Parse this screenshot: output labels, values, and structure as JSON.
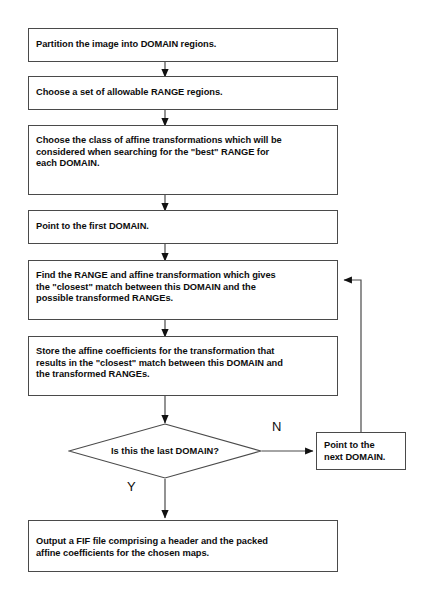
{
  "diagram": {
    "background_color": "#ffffff",
    "line_color": "#4a4a4a",
    "text_color": "#0d0d0d",
    "nodes": [
      {
        "id": "partition",
        "type": "process",
        "text": "Partition the image into DOMAIN regions."
      },
      {
        "id": "choose-range",
        "type": "process",
        "text": "Choose a set of allowable RANGE regions."
      },
      {
        "id": "choose-affine",
        "type": "process",
        "text": "Choose the class of affine transformations which will be\nconsidered when searching for the \"best\" RANGE for\neach DOMAIN."
      },
      {
        "id": "point-first",
        "type": "process",
        "text": "Point to the first DOMAIN."
      },
      {
        "id": "find-range",
        "type": "process",
        "text": "Find the RANGE and affine transformation which gives\nthe \"closest\" match between this DOMAIN and the\npossible transformed RANGEs."
      },
      {
        "id": "store-coeffs",
        "type": "process",
        "text": "Store the affine coefficients for the transformation that\nresults in the \"closest\" match between this DOMAIN and\nthe transformed RANGEs."
      },
      {
        "id": "last-domain",
        "type": "decision",
        "text": "Is this the last DOMAIN?"
      },
      {
        "id": "point-next",
        "type": "process",
        "text": "Point to the\nnext DOMAIN."
      },
      {
        "id": "output-fif",
        "type": "process",
        "text": "Output a FIF file comprising a header and the packed\naffine coefficients for the chosen maps."
      }
    ],
    "edge_labels": {
      "no": "N",
      "yes": "Y"
    }
  }
}
